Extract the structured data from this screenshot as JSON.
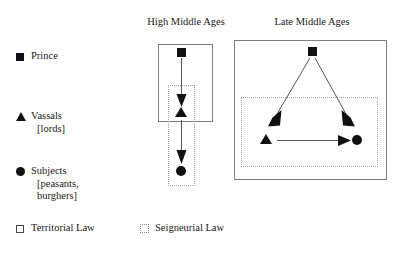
{
  "figure": {
    "panels": [
      {
        "id": "high-middle-ages",
        "title": "High Middle Ages"
      },
      {
        "id": "late-middle-ages",
        "title": "Late Middle Ages"
      }
    ]
  },
  "legend": {
    "entries": [
      {
        "id": "prince",
        "marker": "filled-square-icon",
        "label": "Prince",
        "sub": ""
      },
      {
        "id": "vassals",
        "marker": "filled-triangle-icon",
        "label": "Vassals",
        "sub": "[lords]"
      },
      {
        "id": "subjects",
        "marker": "filled-circle-icon",
        "label": "Subjects",
        "sub": "[peasants,",
        "sub2": "burghers]"
      }
    ],
    "law_keys": [
      {
        "id": "territorial-law",
        "marker": "outline-square-icon",
        "label": "Territorial Law"
      },
      {
        "id": "seigneurial-law",
        "marker": "dotted-square-icon",
        "label": "Seigneurial Law"
      }
    ]
  },
  "colors": {
    "ink": "#111111",
    "box_solid": "#7d7d7d",
    "box_dotted": "#a5a5a5",
    "arrow": "#555555",
    "background": "#ffffff"
  },
  "diagram_data": {
    "type": "relationship-diagram",
    "description": "Comparison of authority relations under territorial law and seigneurial law in the High and Late Middle Ages",
    "panels": [
      {
        "id": "high-middle-ages",
        "title": "High Middle Ages",
        "territorial_law_box": {
          "x": 158,
          "y": 44,
          "w": 55,
          "h": 78
        },
        "seigneurial_law_box": {
          "x": 168,
          "y": 85,
          "w": 27,
          "h": 101
        },
        "nodes": [
          {
            "id": "prince",
            "shape": "square",
            "cx": 181,
            "cy": 52,
            "in_territorial": true,
            "in_seigneurial": false
          },
          {
            "id": "vassal",
            "shape": "triangle",
            "cx": 181,
            "cy": 114,
            "in_territorial": true,
            "in_seigneurial": true
          },
          {
            "id": "subject",
            "shape": "circle",
            "cx": 181,
            "cy": 171,
            "in_territorial": false,
            "in_seigneurial": true
          }
        ],
        "arrows": [
          {
            "from": "prince",
            "to": "vassal",
            "x1": 181,
            "y1": 60,
            "x2": 181,
            "y2": 106
          },
          {
            "from": "vassal",
            "to": "subject",
            "x1": 181,
            "y1": 120,
            "x2": 181,
            "y2": 163
          }
        ]
      },
      {
        "id": "late-middle-ages",
        "title": "Late Middle Ages",
        "territorial_law_box": {
          "x": 234,
          "y": 40,
          "w": 153,
          "h": 140
        },
        "seigneurial_law_box": {
          "x": 241,
          "y": 97,
          "w": 137,
          "h": 70
        },
        "nodes": [
          {
            "id": "prince",
            "shape": "square",
            "cx": 312,
            "cy": 51,
            "in_territorial": true,
            "in_seigneurial": false
          },
          {
            "id": "vassal",
            "shape": "triangle",
            "cx": 266,
            "cy": 141,
            "in_territorial": true,
            "in_seigneurial": true
          },
          {
            "id": "subject",
            "shape": "circle",
            "cx": 357,
            "cy": 140,
            "in_territorial": true,
            "in_seigneurial": true
          }
        ],
        "arrows": [
          {
            "from": "prince",
            "to": "vassal",
            "x1": 310,
            "y1": 58,
            "x2": 272,
            "y2": 128
          },
          {
            "from": "prince",
            "to": "subject",
            "x1": 315,
            "y1": 58,
            "x2": 351,
            "y2": 128
          },
          {
            "from": "vassal",
            "to": "subject",
            "x1": 276,
            "y1": 140,
            "x2": 348,
            "y2": 140
          }
        ]
      }
    ]
  }
}
